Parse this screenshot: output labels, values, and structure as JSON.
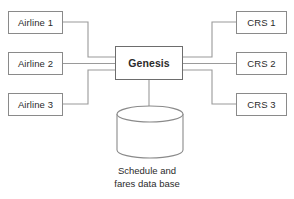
{
  "diagram": {
    "colors": {
      "background": "#ffffff",
      "box_border": "#8a8a8a",
      "hub_border": "#6d6d6d",
      "connector": "#9a9a9a",
      "cylinder_stroke": "#8a8a8a",
      "text": "#2b2b2b"
    },
    "sources": {
      "group_label": "airlines",
      "items": [
        {
          "id": "airline-1",
          "label": "Airline 1",
          "x": 8,
          "y": 11,
          "w": 55,
          "h": 23
        },
        {
          "id": "airline-2",
          "label": "Airline 2",
          "x": 8,
          "y": 52,
          "w": 55,
          "h": 23
        },
        {
          "id": "airline-3",
          "label": "Airline 3",
          "x": 8,
          "y": 93,
          "w": 55,
          "h": 23
        }
      ]
    },
    "hub": {
      "id": "genesis",
      "label": "Genesis",
      "x": 115,
      "y": 46,
      "w": 68,
      "h": 34
    },
    "destinations": {
      "group_label": "crs",
      "items": [
        {
          "id": "crs-1",
          "label": "CRS 1",
          "x": 236,
          "y": 11,
          "w": 51,
          "h": 23
        },
        {
          "id": "crs-2",
          "label": "CRS 2",
          "x": 236,
          "y": 52,
          "w": 51,
          "h": 23
        },
        {
          "id": "crs-3",
          "label": "CRS 3",
          "x": 236,
          "y": 93,
          "w": 51,
          "h": 23
        }
      ]
    },
    "database": {
      "id": "schedule-fares-db",
      "caption_line_1": "Schedule and",
      "caption_line_2": "fares data base",
      "x": 117,
      "y": 106,
      "w": 66,
      "h": 52,
      "ellipse_ry": 8
    },
    "connectors": [
      {
        "id": "airline-1-to-genesis",
        "from": "airline-1",
        "to": "genesis",
        "path": "M 63 22 L 88 22 L 88 57 L 115 57"
      },
      {
        "id": "airline-2-to-genesis",
        "from": "airline-2",
        "to": "genesis",
        "path": "M 63 63.5 L 115 63.5"
      },
      {
        "id": "airline-3-to-genesis",
        "from": "airline-3",
        "to": "genesis",
        "path": "M 63 104 L 88 104 L 88 70 L 115 70"
      },
      {
        "id": "genesis-to-crs-1",
        "from": "genesis",
        "to": "crs-1",
        "path": "M 183 57 L 212 57 L 212 22 L 236 22"
      },
      {
        "id": "genesis-to-crs-2",
        "from": "genesis",
        "to": "crs-2",
        "path": "M 183 63.5 L 236 63.5"
      },
      {
        "id": "genesis-to-crs-3",
        "from": "genesis",
        "to": "crs-3",
        "path": "M 183 70 L 212 70 L 212 104 L 236 104"
      },
      {
        "id": "genesis-to-database",
        "from": "genesis",
        "to": "schedule-fares-db",
        "path": "M 149 80 L 149 106"
      }
    ]
  }
}
